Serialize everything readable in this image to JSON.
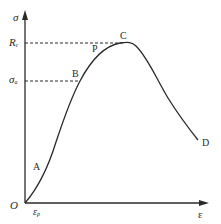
{
  "diagram": {
    "type": "stress-strain curve",
    "axes": {
      "y_label": "σ",
      "x_label": "ε",
      "origin_label": "O"
    },
    "y_ticks": [
      {
        "label": "R",
        "subscript": "c",
        "meaning": "peak strength"
      },
      {
        "label": "σ",
        "subscript": "a",
        "meaning": "stress at B"
      }
    ],
    "x_ticks": [
      {
        "label": "ε",
        "subscript": "p"
      }
    ],
    "points": [
      {
        "label": "A"
      },
      {
        "label": "B"
      },
      {
        "label": "P"
      },
      {
        "label": "C"
      },
      {
        "label": "D"
      }
    ],
    "colors": {
      "line": "#2a2a2a",
      "background": "#ffffff"
    }
  }
}
